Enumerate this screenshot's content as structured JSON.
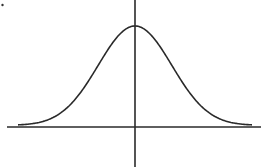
{
  "diagram": {
    "type": "normal-distribution-curve",
    "colors": {
      "stroke": "#2a2a2a",
      "background": "#ffffff"
    },
    "axes": {
      "x_axis_y": 127,
      "y_axis_x": 135
    },
    "curve": {
      "peak": [
        135,
        26
      ],
      "left_end": [
        18,
        124
      ],
      "right_end": [
        252,
        124
      ]
    }
  },
  "chart_data": {
    "type": "line",
    "title": "",
    "xlabel": "",
    "ylabel": "",
    "series": [
      {
        "name": "normal density",
        "shape": "gaussian",
        "mean": 0,
        "symmetric": true
      }
    ],
    "grid": false,
    "legend": null
  }
}
